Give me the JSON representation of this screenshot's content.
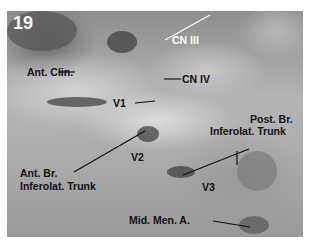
{
  "figure": {
    "number": "19",
    "labels": {
      "cn_iii": "CN III",
      "ant_clin": "Ant. Clin.",
      "cn_iv": "CN IV",
      "v1": "V1",
      "post_br_line1": "Post. Br.",
      "post_br_line2": "Inferolat. Trunk",
      "ant_br_line1": "Ant. Br.",
      "ant_br_line2": "Inferolat. Trunk",
      "v2": "V2",
      "v3": "V3",
      "mid_men_a": "Mid. Men. A."
    }
  }
}
